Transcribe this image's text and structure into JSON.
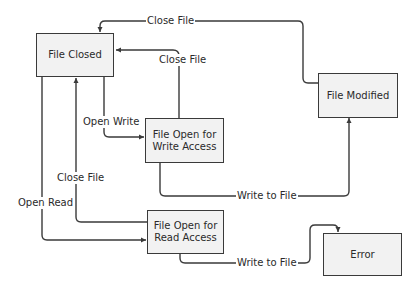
{
  "diagram": {
    "type": "state-transition",
    "states": [
      {
        "id": "file_closed",
        "label": "File Closed"
      },
      {
        "id": "file_open_write",
        "label": "File Open for Write Access"
      },
      {
        "id": "file_open_read",
        "label": "File Open for Read Access"
      },
      {
        "id": "file_modified",
        "label": "File Modified"
      },
      {
        "id": "error",
        "label": "Error"
      }
    ],
    "transitions": [
      {
        "from": "file_modified",
        "to": "file_closed",
        "label": "Close File"
      },
      {
        "from": "file_open_write",
        "to": "file_closed",
        "label": "Close File"
      },
      {
        "from": "file_closed",
        "to": "file_open_write",
        "label": "Open Write"
      },
      {
        "from": "file_open_read",
        "to": "file_closed",
        "label": "Close File"
      },
      {
        "from": "file_closed",
        "to": "file_open_read",
        "label": "Open Read"
      },
      {
        "from": "file_open_write",
        "to": "file_modified",
        "label": "Write to File"
      },
      {
        "from": "file_open_read",
        "to": "error",
        "label": "Write to File"
      }
    ]
  },
  "colors": {
    "stroke": "#3a3a3a",
    "fill": "#f2f2f2",
    "text": "#2a2a2a"
  }
}
